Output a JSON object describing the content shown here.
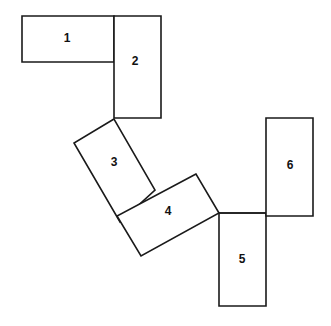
{
  "diagram": {
    "type": "geometric-figure",
    "canvas": {
      "width": 331,
      "height": 326,
      "background": "#ffffff"
    },
    "stroke_color": "#1a1a1a",
    "fill_color": "#ffffff",
    "label_color": "#111111",
    "rectangles": [
      {
        "id": "rect-1",
        "label": "1",
        "orientation": "horizontal",
        "rotation_deg": 0,
        "points": "22,16 114,16 114,62 22,62",
        "label_x": 67,
        "label_y": 39
      },
      {
        "id": "rect-2",
        "label": "2",
        "orientation": "vertical",
        "rotation_deg": 0,
        "points": "114,16 161,16 161,118 114,118",
        "label_x": 135,
        "label_y": 62
      },
      {
        "id": "rect-3",
        "label": "3",
        "orientation": "tilted",
        "rotation_deg": -31,
        "points": "114,119 74,143 120,222 155,190",
        "label_x": 114,
        "label_y": 163
      },
      {
        "id": "rect-4",
        "label": "4",
        "orientation": "tilted",
        "rotation_deg": -28,
        "points": "196,174 117,216 141,256 219,213",
        "label_x": 168,
        "label_y": 212
      },
      {
        "id": "rect-5",
        "label": "5",
        "orientation": "vertical",
        "rotation_deg": 0,
        "points": "219,213 266,213 266,306 219,306",
        "label_x": 242,
        "label_y": 260
      },
      {
        "id": "rect-6",
        "label": "6",
        "orientation": "vertical",
        "rotation_deg": 0,
        "points": "266,118 313,118 313,216 266,216",
        "label_x": 290,
        "label_y": 166
      }
    ],
    "connector_segments": [
      {
        "id": "seg-4-to-6",
        "x1": 219,
        "y1": 213,
        "x2": 266,
        "y2": 213
      }
    ]
  }
}
